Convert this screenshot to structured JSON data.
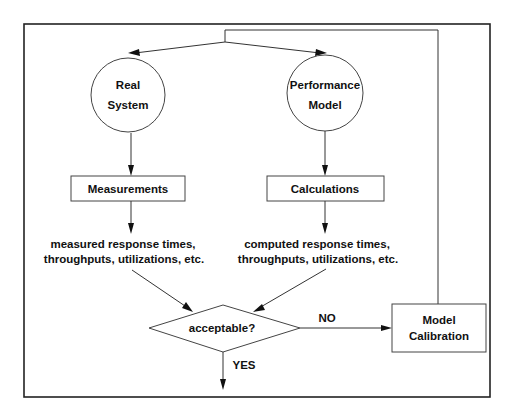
{
  "diagram": {
    "nodes": {
      "real_system": {
        "line1": "Real",
        "line2": "System"
      },
      "performance_model": {
        "line1": "Performance",
        "line2": "Model"
      },
      "measurements": {
        "label": "Measurements"
      },
      "calculations": {
        "label": "Calculations"
      },
      "measured_output": {
        "line1": "measured response times,",
        "line2": "throughputs, utilizations, etc."
      },
      "computed_output": {
        "line1": "computed response times,",
        "line2": "throughputs, utilizations, etc."
      },
      "decision": {
        "label": "acceptable?"
      },
      "model_calibration": {
        "line1": "Model",
        "line2": "Calibration"
      }
    },
    "edges": {
      "no_label": "NO",
      "yes_label": "YES"
    },
    "colors": {
      "stroke": "#333333",
      "text": "#111111",
      "background": "#ffffff"
    }
  }
}
